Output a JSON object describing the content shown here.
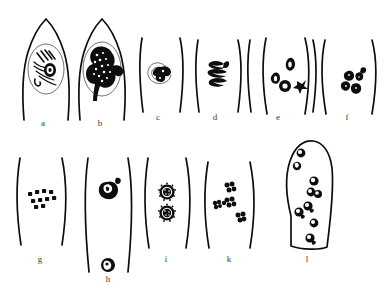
{
  "figure": {
    "kind": "scientific-line-drawing-plate",
    "medium": "black ink line drawing",
    "background_color": "#ffffff",
    "ink_color": "#0d0d0d",
    "label_color": "#3a3a3a",
    "width": 390,
    "height": 290,
    "rows": 2,
    "columns_top": 6,
    "columns_bottom": 5,
    "caption": ""
  },
  "panels": [
    {
      "label": "a",
      "row": 1,
      "order": 1,
      "cell_shape": "pointed-apex-cell",
      "label_x": 43,
      "label_y": 126,
      "contents": "oval nucleus with elongated striated chromosome threads and a dense chromatin knot",
      "nuclei_count": 1
    },
    {
      "label": "b",
      "row": 1,
      "order": 2,
      "cell_shape": "pointed-apex-cell",
      "label_x": 100,
      "label_y": 126,
      "contents": "oval nucleus filled by a large dark condensed stippled chromatin mass with trailing arms",
      "nuclei_count": 1
    },
    {
      "label": "c",
      "row": 1,
      "order": 3,
      "cell_shape": "open-wall-pair",
      "label_x": 158,
      "label_y": 120,
      "contents": "small spiral nuclear envelope with a compact dark chromatin clump",
      "nuclei_count": 1
    },
    {
      "label": "d",
      "row": 1,
      "order": 4,
      "cell_shape": "open-wall-pair",
      "label_x": 215,
      "label_y": 120,
      "contents": "naked dark zigzag condensed chromatin figure, no visible envelope",
      "nuclei_count": 1
    },
    {
      "label": "e",
      "row": 1,
      "order": 5,
      "cell_shape": "open-wall-pair",
      "label_x": 278,
      "label_y": 120,
      "contents": "four separate small dark ring-shaped nuclei spread apart",
      "nuclei_count": 4
    },
    {
      "label": "f",
      "row": 1,
      "order": 6,
      "cell_shape": "open-wall-pair",
      "label_x": 347,
      "label_y": 120,
      "contents": "tight cluster of small dark angular chromatin fragments",
      "nuclei_count": 5
    },
    {
      "label": "g",
      "row": 2,
      "order": 1,
      "cell_shape": "open-wall-pair",
      "label_x": 40,
      "label_y": 262,
      "contents": "horizontal band of about ten small dark square chromatin dots",
      "nuclei_count": 10
    },
    {
      "label": "h",
      "row": 2,
      "order": 2,
      "cell_shape": "open-wall-pair",
      "label_x": 108,
      "label_y": 282,
      "contents": "two dark round nuclei with pale crescent insets, widely separated along the cell",
      "nuclei_count": 2
    },
    {
      "label": "i",
      "row": 2,
      "order": 3,
      "cell_shape": "open-wall-pair",
      "label_x": 166,
      "label_y": 262,
      "contents": "two stippled circular nuclei with radiating speckled margins",
      "nuclei_count": 2
    },
    {
      "label": "k",
      "row": 2,
      "order": 4,
      "cell_shape": "open-wall-pair",
      "label_x": 229,
      "label_y": 262,
      "contents": "four clover-like rosettes of dark chromatin granules",
      "nuclei_count": 4
    },
    {
      "label": "l",
      "row": 2,
      "order": 5,
      "cell_shape": "closed-elongate-cell",
      "label_x": 307,
      "label_y": 262,
      "contents": "whole elongated cell containing about nine dark nuclei scattered along its length",
      "nuclei_count": 9
    }
  ]
}
